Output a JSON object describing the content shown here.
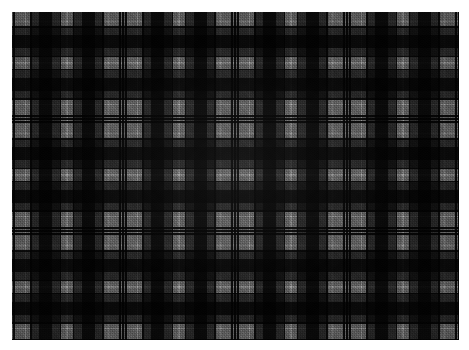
{
  "image": {
    "kind": "textile-swatch",
    "subject": "tartan plaid fabric",
    "weave": "2/2 twill",
    "palette_mode": "greyscale",
    "width_px": 469,
    "height_px": 350,
    "background_color": "#ffffff",
    "margin": {
      "left_px": 12,
      "top_px": 12,
      "right_px": 10,
      "bottom_px": 10
    },
    "cloth": {
      "left_px": 12,
      "top_px": 12,
      "width_px": 447,
      "height_px": 328
    }
  },
  "colors": {
    "light_grey": "#9a9a9a",
    "mid_grey": "#8e8e8e",
    "dark_grey": "#3c3c3c",
    "charcoal": "#242424",
    "black": "#0d0d0d",
    "guard_line": "#050505",
    "pinstripe": "#c8c8c8",
    "paper_white": "#ffffff"
  },
  "sett": {
    "repeat_px": 112,
    "symmetric": true,
    "description": "Symmetric grey tartan sett: wide light ground, black block, dark-grey block, black guard pairs and a fine light pinstripe at each pivot.",
    "bands": [
      {
        "color": "#0d0d0d",
        "width_px": 4,
        "name": "black-guard"
      },
      {
        "color": "#9a9a9a",
        "width_px": 2,
        "name": "light-pinstripe-edge"
      },
      {
        "color": "#0d0d0d",
        "width_px": 3,
        "name": "black-guard-inner"
      },
      {
        "color": "#9a9a9a",
        "width_px": 20,
        "name": "light-ground"
      },
      {
        "color": "#c8c8c8",
        "width_px": 2,
        "name": "light-pinstripe"
      },
      {
        "color": "#9a9a9a",
        "width_px": 9,
        "name": "light-ground"
      },
      {
        "color": "#0d0d0d",
        "width_px": 3,
        "name": "black-guard"
      },
      {
        "color": "#3c3c3c",
        "width_px": 14,
        "name": "dark-grey-block"
      },
      {
        "color": "#0d0d0d",
        "width_px": 26,
        "name": "black-block"
      },
      {
        "color": "#3c3c3c",
        "width_px": 14,
        "name": "dark-grey-block"
      },
      {
        "color": "#0d0d0d",
        "width_px": 3,
        "name": "black-guard"
      },
      {
        "color": "#9a9a9a",
        "width_px": 9,
        "name": "light-ground"
      },
      {
        "color": "#c8c8c8",
        "width_px": 2,
        "name": "light-pinstripe"
      },
      {
        "color": "#9a9a9a",
        "width_px": 1,
        "name": "light-ground"
      }
    ]
  },
  "warp": {
    "axis": "vertical",
    "offset_px": -2,
    "repeat_px": 112,
    "count_visible": 4
  },
  "weft": {
    "axis": "horizontal",
    "offset_px": -4,
    "repeat_px": 112,
    "count_visible": 3
  },
  "texture": {
    "twill_angle_deg": 45,
    "thread_pitch_px": 2,
    "vignette": true,
    "grain": true
  }
}
